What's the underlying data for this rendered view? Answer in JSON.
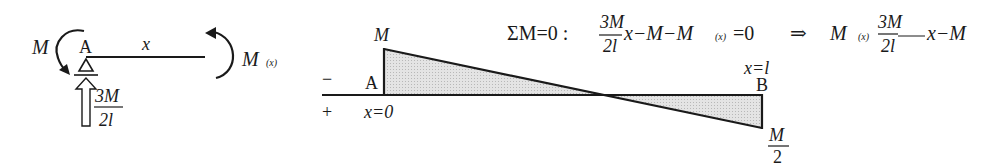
{
  "free_body": {
    "moment_left_label": "M",
    "point_a_label": "A",
    "segment_label": "x",
    "moment_right_label": "M",
    "moment_right_sub": "(x)",
    "reaction_num": "3M",
    "reaction_den": "2l"
  },
  "equation": {
    "lead": "ΣM=0 : ",
    "frac_num": "3M",
    "frac_den": "2l",
    "terms": "x−M−M",
    "sub": "(x)",
    "eq_zero": " =0",
    "implies": "⇒",
    "result_lhs": "M",
    "result_sub": "(x)",
    "result_frac_num": "3M",
    "result_frac_den": "2l",
    "result_rest": "x−M"
  },
  "moment_diagram": {
    "top_label_a": "M",
    "point_a_label": "A",
    "sign_minus": "−",
    "sign_plus": "+",
    "x_start_label": "x=0",
    "x_end_label": "x=l",
    "point_b_label": "B",
    "end_value_num": "M",
    "end_value_den": "2",
    "fill_color": "#d9d9d9",
    "line_color": "#1a1a1a"
  }
}
